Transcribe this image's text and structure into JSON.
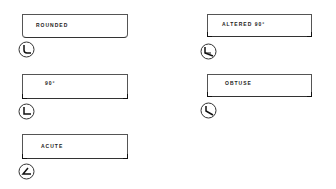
{
  "diagram": {
    "items": [
      {
        "label": "ROUNDED",
        "corner": "rounded"
      },
      {
        "label": "ALTERED 90°",
        "corner": "altered-90"
      },
      {
        "label": "90°",
        "corner": "90"
      },
      {
        "label": "OBTUSE",
        "corner": "obtuse"
      },
      {
        "label": "ACUTE",
        "corner": "acute"
      }
    ],
    "stroke_color": "#333333",
    "background": "#ffffff"
  }
}
